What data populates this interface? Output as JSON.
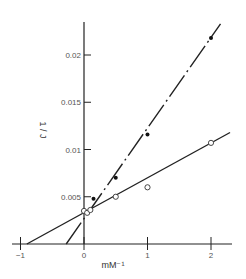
{
  "chart_data": {
    "type": "scatter",
    "title": "",
    "xlabel": "mM⁻¹",
    "ylabel": "1 / J",
    "xlim": [
      -1.0,
      2.3
    ],
    "ylim": [
      0,
      0.0245
    ],
    "x_ticks": [
      -1,
      0,
      1,
      2
    ],
    "x_tick_labels": [
      "−1",
      "0",
      "1",
      "2"
    ],
    "y_ticks": [
      0.005,
      0.01,
      0.015,
      0.02
    ],
    "y_tick_labels": [
      "0.005",
      "0.01",
      "0.015",
      "0.02"
    ],
    "grid": false,
    "legend": null,
    "series": [
      {
        "name": "filled",
        "marker": "filled-circle",
        "line_style": "dash-dot",
        "x": [
          0.15,
          0.5,
          1.0,
          2.0
        ],
        "y": [
          0.0048,
          0.007,
          0.0116,
          0.0218
        ],
        "fit_line": {
          "x": [
            -0.28,
            2.15
          ],
          "y": [
            0.0,
            0.0233
          ]
        }
      },
      {
        "name": "open",
        "marker": "open-circle",
        "line_style": "solid",
        "x": [
          0.0,
          0.05,
          0.1,
          0.5,
          1.0,
          2.0
        ],
        "y": [
          0.0035,
          0.0033,
          0.0036,
          0.005,
          0.006,
          0.0107
        ],
        "fit_line": {
          "x": [
            -0.9,
            2.3
          ],
          "y": [
            0.0,
            0.0118
          ]
        }
      }
    ]
  }
}
